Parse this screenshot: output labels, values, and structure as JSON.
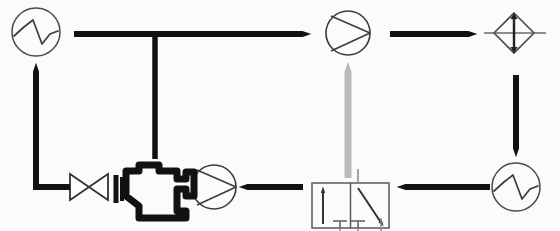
{
  "diagram": {
    "type": "schematic-flow-diagram",
    "canvas": {
      "width": 560,
      "height": 231,
      "background": "#fbfbfa"
    },
    "colors": {
      "line_black": "#111111",
      "symbol_outline": "#4a4a4a",
      "gray_arrow": "#b9b9b9",
      "valve_outline": "#555555",
      "background": "#fbfbfa"
    },
    "components": [
      {
        "id": "heat-exchanger-top-left",
        "label": "Heat exchanger (cooler)",
        "symbol": "circle-sine-wave",
        "x": 36,
        "y": 32,
        "r": 24
      },
      {
        "id": "pump-top-right",
        "label": "Pump",
        "symbol": "circle-triangle-pump",
        "x": 348,
        "y": 33,
        "r": 22
      },
      {
        "id": "relief-valve-diamond",
        "label": "Pressure relief valve",
        "symbol": "diamond-double-arrow",
        "x": 514,
        "y": 33,
        "half": 20
      },
      {
        "id": "heat-exchanger-bottom-right",
        "label": "Heat exchanger (cooler)",
        "symbol": "circle-sine-wave",
        "x": 516,
        "y": 187,
        "r": 24
      },
      {
        "id": "directional-control-valve",
        "label": "Directional control valve (4/2)",
        "symbol": "two-position-valve-box",
        "x": 312,
        "y": 183,
        "width": 77,
        "height": 45
      },
      {
        "id": "pump-bottom",
        "label": "Pump",
        "symbol": "circle-triangle-pump",
        "x": 214,
        "y": 187,
        "r": 22
      },
      {
        "id": "engine-block",
        "label": "Engine",
        "symbol": "engine-block-icon",
        "x": 122,
        "y": 162,
        "width": 74,
        "height": 56
      },
      {
        "id": "gate-valve-bowtie",
        "label": "Gate valve",
        "symbol": "bowtie-valve",
        "x": 70,
        "y": 174,
        "width": 38,
        "height": 26
      }
    ],
    "connections": [
      {
        "id": "flow-top-left-to-pump",
        "label": "Top supply line, left to right",
        "direction": "right",
        "color": "#111111"
      },
      {
        "id": "flow-tee-drop",
        "label": "Tee branch dropping down",
        "direction": "down",
        "color": "#111111"
      },
      {
        "id": "flow-pump-to-relief",
        "label": "Pump to relief valve",
        "direction": "right",
        "color": "#111111"
      },
      {
        "id": "flow-relief-to-cooler",
        "label": "Relief valve down to cooler",
        "direction": "down",
        "color": "#111111"
      },
      {
        "id": "flow-cooler-to-valve",
        "label": "Cooler to directional valve",
        "direction": "left",
        "color": "#111111"
      },
      {
        "id": "flow-valve-to-pump",
        "label": "Directional valve to pump",
        "direction": "left",
        "color": "#111111"
      },
      {
        "id": "flow-valve-pilot-up",
        "label": "Pilot line up to pump",
        "direction": "up",
        "color": "#b9b9b9"
      },
      {
        "id": "flow-engine-return",
        "label": "Engine return up to cooler",
        "direction": "up",
        "color": "#111111"
      }
    ]
  }
}
